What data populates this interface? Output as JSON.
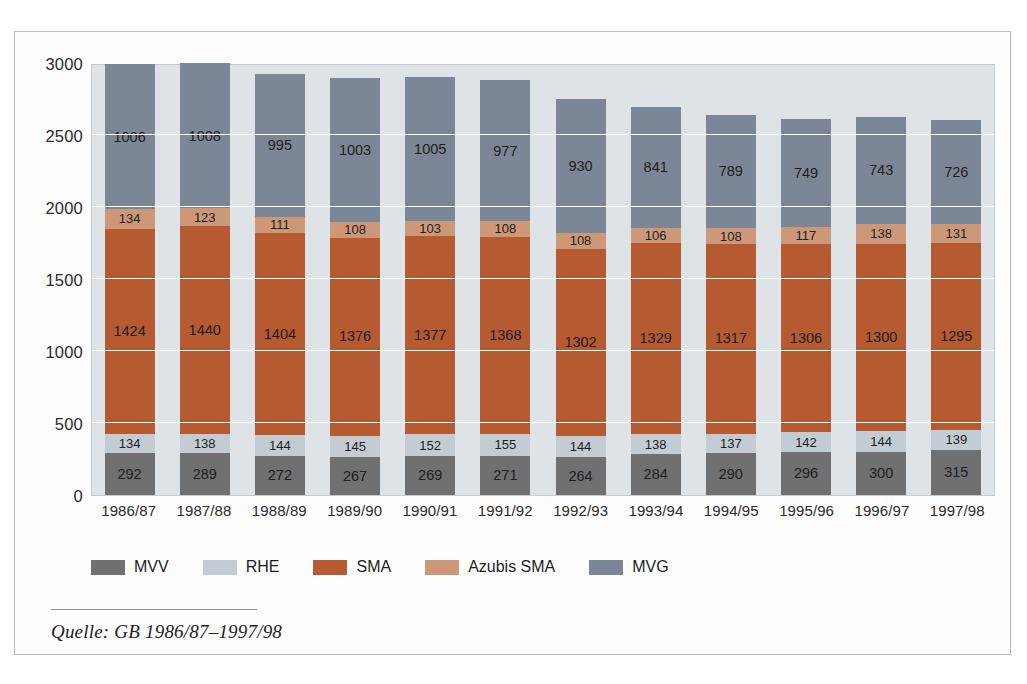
{
  "chart_data": {
    "type": "bar",
    "subtype": "stacked-bar",
    "title": "",
    "xlabel": "",
    "ylabel": "",
    "ylim": [
      0,
      3000
    ],
    "yticks": [
      0,
      500,
      1000,
      1500,
      2000,
      2500,
      3000
    ],
    "ytick_labels": [
      "0",
      "500",
      "1000",
      "1500",
      "2000",
      "2500",
      "3000"
    ],
    "grid": true,
    "grid_axis": "y",
    "legend_position": "bottom-left",
    "categories": [
      "1986/87",
      "1987/88",
      "1988/89",
      "1989/90",
      "1990/91",
      "1991/92",
      "1992/93",
      "1993/94",
      "1994/95",
      "1995/96",
      "1996/97",
      "1997/98"
    ],
    "series": [
      {
        "name": "MVV",
        "color": "#6f7072",
        "values": [
          292,
          289,
          272,
          267,
          269,
          271,
          264,
          284,
          290,
          296,
          300,
          315
        ]
      },
      {
        "name": "RHE",
        "color": "#c3ccd2",
        "values": [
          134,
          138,
          144,
          145,
          152,
          155,
          144,
          138,
          137,
          142,
          144,
          139
        ]
      },
      {
        "name": "SMA",
        "color": "#b65a31",
        "values": [
          1424,
          1440,
          1404,
          1376,
          1377,
          1368,
          1302,
          1329,
          1317,
          1306,
          1300,
          1295
        ]
      },
      {
        "name": "Azubis SMA",
        "color": "#cd9878",
        "values": [
          134,
          123,
          111,
          108,
          103,
          108,
          108,
          106,
          108,
          117,
          138,
          131
        ]
      },
      {
        "name": "MVG",
        "color": "#7b8796",
        "values": [
          1006,
          1008,
          995,
          1003,
          1005,
          977,
          930,
          841,
          789,
          749,
          743,
          726
        ]
      }
    ],
    "totals": [
      2990,
      2998,
      2926,
      2899,
      2906,
      2879,
      2748,
      2698,
      2641,
      2610,
      2625,
      2606
    ]
  },
  "source": {
    "text": "Quelle: GB 1986/87–1997/98"
  },
  "colors": {
    "plot_background": "#dde3e6",
    "figure_background": "#fdfdfd",
    "frame_border": "#b9bcbe",
    "gridline": "#ffffff",
    "text": "#1d1d1d"
  }
}
